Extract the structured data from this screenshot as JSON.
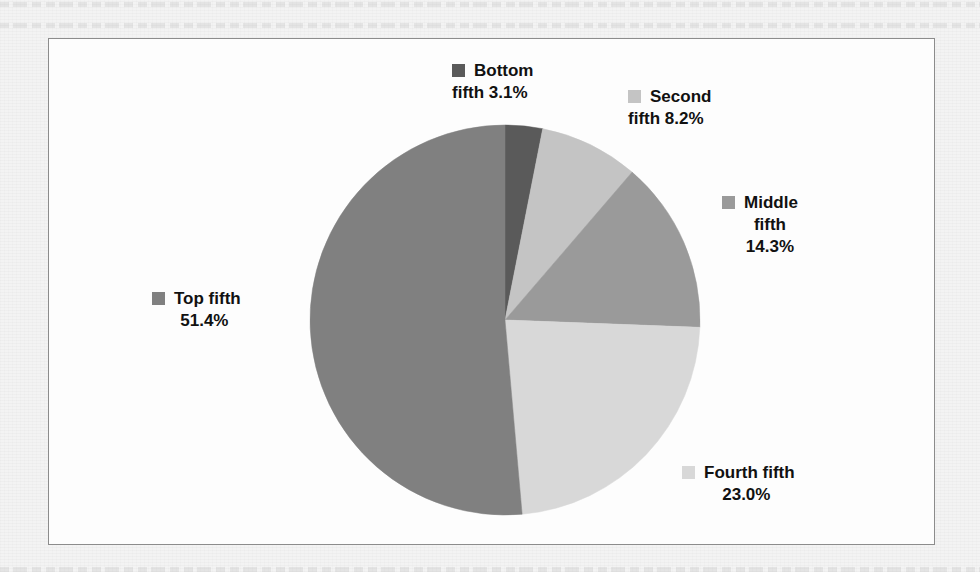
{
  "page": {
    "background": "#f3f3f3",
    "frame_border_color": "#8c8c8c",
    "frame_background": "#fdfdfd"
  },
  "chart_data": {
    "type": "pie",
    "title": "",
    "subtitle": "",
    "xlabel": "",
    "ylabel": "",
    "legend_position": "callout-labels",
    "grid": false,
    "start_angle_deg": 0,
    "direction": "clockwise",
    "center": {
      "x": 505,
      "y": 320
    },
    "radius": 195,
    "categories": [
      "Bottom fifth",
      "Second fifth",
      "Middle fifth",
      "Fourth fifth",
      "Top fifth"
    ],
    "values": [
      3.1,
      8.2,
      14.3,
      23.0,
      51.4
    ],
    "value_suffix": "%",
    "total": 100.0,
    "colors": [
      "#5a5a5a",
      "#c4c4c4",
      "#9a9a9a",
      "#d8d8d8",
      "#808080"
    ],
    "slices": [
      {
        "name": "Bottom fifth",
        "value": 3.1,
        "value_text": "3.1%",
        "color": "#5a5a5a",
        "label_line1": "Bottom",
        "label_line2": "fifth 3.1%",
        "label_line3": "",
        "start_deg": 0.0,
        "end_deg": 11.16
      },
      {
        "name": "Second fifth",
        "value": 8.2,
        "value_text": "8.2%",
        "color": "#c4c4c4",
        "label_line1": "Second",
        "label_line2": "fifth 8.2%",
        "label_line3": "",
        "start_deg": 11.16,
        "end_deg": 40.68
      },
      {
        "name": "Middle fifth",
        "value": 14.3,
        "value_text": "14.3%",
        "color": "#9a9a9a",
        "label_line1": "Middle",
        "label_line2": "fifth",
        "label_line3": "14.3%",
        "start_deg": 40.68,
        "end_deg": 92.16
      },
      {
        "name": "Fourth fifth",
        "value": 23.0,
        "value_text": "23.0%",
        "color": "#d8d8d8",
        "label_line1": "Fourth fifth",
        "label_line2": "23.0%",
        "label_line3": "",
        "start_deg": 92.16,
        "end_deg": 174.96
      },
      {
        "name": "Top fifth",
        "value": 51.4,
        "value_text": "51.4%",
        "color": "#808080",
        "label_line1": "Top fifth",
        "label_line2": "51.4%",
        "label_line3": "",
        "start_deg": 174.96,
        "end_deg": 360.0
      }
    ]
  }
}
